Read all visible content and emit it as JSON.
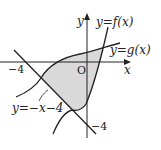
{
  "diagram": {
    "axes": {
      "x_label": "x",
      "y_label": "y",
      "origin_label": "O",
      "x_tick_label": "−4",
      "y_tick_label": "−4"
    },
    "curves": [
      {
        "name": "f",
        "label": "y=f(x)"
      },
      {
        "name": "g",
        "label": "y=g(x)"
      },
      {
        "name": "line",
        "label": "y=−x−4"
      }
    ],
    "shaded_region": {
      "fill": "#d9d9d9",
      "description": "region bounded by y=f(x), y=g(x), and y=−x−4"
    },
    "colors": {
      "stroke": "#222222",
      "shade": "#d9d9d9"
    }
  }
}
